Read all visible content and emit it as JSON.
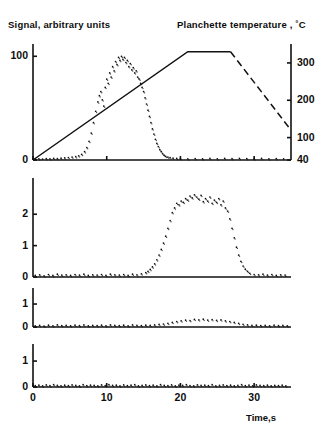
{
  "figure": {
    "title_left": "Signal, arbitrary units",
    "title_right": "Planchette temperature , ˚C",
    "xaxis_title": "Time,s",
    "background": "#ffffff",
    "ink": "#111111"
  },
  "axes": {
    "x_ticks": [
      "0",
      "10",
      "20",
      "30"
    ],
    "x_tick_values": [
      0,
      10,
      20,
      30
    ],
    "panel1_left_ticks": [
      "0",
      "100"
    ],
    "panel1_left_values": [
      0,
      100
    ],
    "panel1_right_ticks": [
      "40",
      "100",
      "200",
      "300"
    ],
    "panel1_right_values": [
      40,
      100,
      200,
      300
    ],
    "panel2_ticks": [
      "0",
      "1",
      "2"
    ],
    "panel2_values": [
      0,
      1,
      2
    ],
    "panel3_ticks": [
      "0",
      "1"
    ],
    "panel3_values": [
      0,
      1
    ],
    "panel4_ticks": [
      "0",
      "1"
    ],
    "panel4_values": [
      0,
      1
    ]
  },
  "chart_data": [
    {
      "type": "scatter",
      "panel": 1,
      "title": "Signal, arbitrary units",
      "xlabel": "Time,s",
      "ylabel": "Signal, arbitrary units",
      "y2label": "Planchette temperature , ˚C",
      "xlim": [
        0,
        35
      ],
      "ylim": [
        0,
        108
      ],
      "y2lim": [
        40,
        340
      ],
      "grid": false,
      "legend": "none",
      "series": [
        {
          "name": "signal-scatter",
          "style": "dots",
          "x": [
            0.3,
            0.8,
            1.3,
            1.8,
            2.3,
            2.8,
            3.3,
            3.8,
            4.3,
            4.8,
            5.3,
            5.8,
            6.2,
            6.6,
            7.0,
            7.3,
            7.6,
            7.9,
            8.2,
            8.5,
            8.8,
            9.0,
            9.2,
            9.4,
            9.6,
            9.8,
            10.0,
            10.2,
            10.4,
            10.6,
            10.8,
            11.0,
            11.2,
            11.4,
            11.6,
            11.8,
            12.0,
            12.2,
            12.4,
            12.6,
            12.8,
            13.0,
            13.2,
            13.4,
            13.6,
            13.8,
            14.0,
            14.2,
            14.4,
            14.6,
            14.8,
            15.0,
            15.2,
            15.4,
            15.6,
            15.8,
            16.0,
            16.2,
            16.4,
            16.6,
            16.8,
            17.0,
            17.2,
            17.4,
            17.6,
            17.8,
            18.0,
            18.3,
            18.6,
            19.0,
            19.5,
            20.0,
            21.0,
            22.0,
            23.0,
            24.0,
            25.0,
            26.0,
            27.0,
            28.0,
            29.0,
            30.0,
            31.0,
            32.0,
            33.0,
            34.0
          ],
          "y": [
            1.0,
            1.2,
            0.9,
            1.4,
            1.1,
            1.6,
            1.3,
            1.8,
            2.0,
            2.4,
            2.8,
            3.2,
            4.0,
            5.5,
            8.0,
            12.0,
            18.0,
            26.0,
            36.0,
            47.0,
            56.0,
            62.0,
            66.0,
            58.0,
            52.0,
            70.0,
            78.0,
            74.0,
            84.0,
            80.0,
            90.0,
            86.0,
            95.0,
            92.0,
            99.0,
            96.0,
            100.0,
            97.0,
            99.0,
            94.0,
            96.0,
            90.0,
            93.0,
            87.0,
            89.0,
            84.0,
            86.0,
            80.0,
            78.0,
            74.0,
            70.0,
            66.0,
            60.0,
            54.0,
            48.0,
            42.0,
            36.0,
            30.0,
            25.0,
            20.0,
            16.0,
            13.0,
            10.0,
            8.0,
            6.0,
            4.5,
            3.5,
            2.8,
            2.2,
            1.8,
            1.5,
            1.3,
            1.2,
            1.4,
            1.1,
            1.5,
            1.2,
            1.6,
            1.3,
            1.7,
            1.4,
            1.2,
            1.5,
            1.1,
            1.3,
            1.0
          ]
        },
        {
          "name": "planchette-temperature-ramp",
          "style": "solid-then-dashed",
          "axis": "right",
          "x": [
            0,
            21.0,
            26.8,
            35.0
          ],
          "y": [
            40,
            330,
            330,
            120
          ],
          "dashed_from_x": 26.8
        }
      ]
    },
    {
      "type": "scatter",
      "panel": 2,
      "xlabel": "Time,s",
      "xlim": [
        0,
        35
      ],
      "ylim": [
        0,
        2.9
      ],
      "grid": false,
      "legend": "none",
      "series": [
        {
          "name": "panel2-scatter",
          "style": "dots",
          "x": [
            0.3,
            0.9,
            1.5,
            2.1,
            2.7,
            3.3,
            3.9,
            4.5,
            5.1,
            5.7,
            6.3,
            6.9,
            7.5,
            8.1,
            8.7,
            9.3,
            9.9,
            10.5,
            11.1,
            11.7,
            12.3,
            12.9,
            13.5,
            14.1,
            14.7,
            15.3,
            15.6,
            15.9,
            16.2,
            16.5,
            16.8,
            17.1,
            17.4,
            17.7,
            18.0,
            18.3,
            18.6,
            18.9,
            19.2,
            19.5,
            19.8,
            20.1,
            20.4,
            20.7,
            21.0,
            21.3,
            21.6,
            21.9,
            22.2,
            22.5,
            22.8,
            23.1,
            23.4,
            23.7,
            24.0,
            24.3,
            24.6,
            24.9,
            25.2,
            25.5,
            25.8,
            26.1,
            26.4,
            26.7,
            27.0,
            27.3,
            27.6,
            27.9,
            28.2,
            28.5,
            28.8,
            29.1,
            29.4,
            30.0,
            30.6,
            31.2,
            31.8,
            32.4,
            33.0,
            33.6,
            34.2
          ],
          "y": [
            0.05,
            0.07,
            0.04,
            0.08,
            0.05,
            0.09,
            0.06,
            0.07,
            0.05,
            0.08,
            0.06,
            0.09,
            0.05,
            0.07,
            0.06,
            0.08,
            0.05,
            0.09,
            0.07,
            0.06,
            0.08,
            0.05,
            0.09,
            0.07,
            0.1,
            0.14,
            0.18,
            0.24,
            0.32,
            0.42,
            0.55,
            0.7,
            0.88,
            1.08,
            1.3,
            1.55,
            1.8,
            2.05,
            2.2,
            2.35,
            2.3,
            2.42,
            2.38,
            2.5,
            2.45,
            2.58,
            2.52,
            2.62,
            2.55,
            2.48,
            2.6,
            2.4,
            2.5,
            2.42,
            2.55,
            2.35,
            2.45,
            2.38,
            2.5,
            2.3,
            2.42,
            2.2,
            2.1,
            1.85,
            1.55,
            1.25,
            0.95,
            0.7,
            0.5,
            0.35,
            0.25,
            0.18,
            0.12,
            0.08,
            0.07,
            0.09,
            0.06,
            0.08,
            0.05,
            0.07,
            0.06
          ]
        }
      ]
    },
    {
      "type": "scatter",
      "panel": 3,
      "xlabel": "Time,s",
      "xlim": [
        0,
        35
      ],
      "ylim": [
        0,
        1.35
      ],
      "grid": false,
      "legend": "none",
      "series": [
        {
          "name": "panel3-scatter",
          "style": "dots",
          "x": [
            0.3,
            0.9,
            1.5,
            2.1,
            2.7,
            3.3,
            3.9,
            4.5,
            5.1,
            5.7,
            6.3,
            6.9,
            7.5,
            8.1,
            8.7,
            9.3,
            9.9,
            10.5,
            11.1,
            11.7,
            12.3,
            12.9,
            13.5,
            14.1,
            14.7,
            15.3,
            15.9,
            16.5,
            17.1,
            17.7,
            18.3,
            18.9,
            19.5,
            20.1,
            20.7,
            21.3,
            21.9,
            22.5,
            23.1,
            23.7,
            24.3,
            24.9,
            25.5,
            26.1,
            26.7,
            27.3,
            27.9,
            28.5,
            29.1,
            29.7,
            30.3,
            30.9,
            31.5,
            32.1,
            32.7,
            33.3,
            33.9,
            34.5
          ],
          "y": [
            0.05,
            0.07,
            0.04,
            0.08,
            0.05,
            0.09,
            0.06,
            0.07,
            0.05,
            0.08,
            0.06,
            0.09,
            0.05,
            0.07,
            0.06,
            0.08,
            0.05,
            0.09,
            0.07,
            0.06,
            0.08,
            0.05,
            0.09,
            0.07,
            0.06,
            0.08,
            0.07,
            0.09,
            0.11,
            0.13,
            0.16,
            0.2,
            0.24,
            0.27,
            0.3,
            0.28,
            0.33,
            0.31,
            0.34,
            0.3,
            0.32,
            0.29,
            0.31,
            0.27,
            0.24,
            0.2,
            0.16,
            0.12,
            0.09,
            0.07,
            0.08,
            0.06,
            0.07,
            0.05,
            0.08,
            0.06,
            0.07,
            0.05
          ]
        }
      ]
    },
    {
      "type": "scatter",
      "panel": 4,
      "xlabel": "Time,s",
      "xlim": [
        0,
        35
      ],
      "ylim": [
        0,
        1.35
      ],
      "grid": false,
      "legend": "none",
      "series": [
        {
          "name": "panel4-scatter",
          "style": "dots",
          "x": [
            0.3,
            0.8,
            1.3,
            1.8,
            2.3,
            2.8,
            3.3,
            3.8,
            4.3,
            4.8,
            5.3,
            5.8,
            6.3,
            6.8,
            7.3,
            7.8,
            8.3,
            8.8,
            9.3,
            9.8,
            10.3,
            10.8,
            11.3,
            11.8,
            12.3,
            12.8,
            13.3,
            13.8,
            14.3,
            14.8,
            15.3,
            15.8,
            16.3,
            16.8,
            17.3,
            17.8,
            18.3,
            18.8,
            19.3,
            19.8,
            20.3,
            20.8,
            21.3,
            21.8,
            22.3,
            22.8,
            23.3,
            23.8,
            24.3,
            24.8,
            25.3,
            25.8,
            26.3,
            26.8,
            27.3,
            27.8,
            28.3,
            28.8,
            29.3,
            29.8,
            30.3,
            30.8,
            31.3,
            31.8,
            32.3,
            32.8,
            33.3,
            33.8,
            34.3
          ],
          "y": [
            0.05,
            0.07,
            0.04,
            0.08,
            0.05,
            0.09,
            0.06,
            0.04,
            0.07,
            0.05,
            0.08,
            0.06,
            0.04,
            0.09,
            0.05,
            0.07,
            0.06,
            0.04,
            0.08,
            0.05,
            0.09,
            0.06,
            0.07,
            0.04,
            0.08,
            0.05,
            0.07,
            0.09,
            0.04,
            0.06,
            0.08,
            0.05,
            0.07,
            0.04,
            0.09,
            0.06,
            0.05,
            0.08,
            0.04,
            0.07,
            0.06,
            0.09,
            0.05,
            0.04,
            0.08,
            0.06,
            0.07,
            0.05,
            0.09,
            0.04,
            0.06,
            0.08,
            0.05,
            0.07,
            0.04,
            0.06,
            0.09,
            0.05,
            0.07,
            0.04,
            0.08,
            0.06,
            0.05,
            0.07,
            0.04,
            0.06,
            0.05,
            0.07,
            0.04
          ]
        }
      ]
    }
  ]
}
